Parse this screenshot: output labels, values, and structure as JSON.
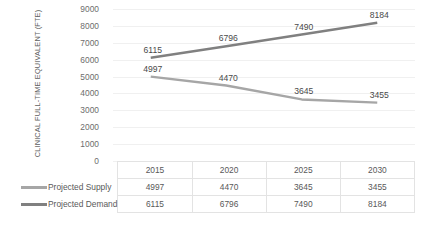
{
  "chart_data": {
    "type": "line",
    "title": "",
    "xlabel": "",
    "ylabel": "CLINICAL FULL-TIME EQUIVALENT (FTE)",
    "categories": [
      "2015",
      "2020",
      "2025",
      "2030"
    ],
    "series": [
      {
        "name": "Projected Supply",
        "values": [
          4997,
          4470,
          3645,
          3455
        ],
        "color": "#a6a6a6"
      },
      {
        "name": "Projected Demand",
        "values": [
          6115,
          6796,
          7490,
          8184
        ],
        "color": "#808080"
      }
    ],
    "ylim": [
      0,
      9000
    ],
    "ytick_labels": [
      "9000",
      "8000",
      "7000",
      "6000",
      "5000",
      "4000",
      "3000",
      "2000",
      "1000",
      "0"
    ],
    "ytick_values": [
      9000,
      8000,
      7000,
      6000,
      5000,
      4000,
      3000,
      2000,
      1000,
      0
    ],
    "grid": true,
    "legend_position": "data-table-left",
    "data_labels": true,
    "data_table": {
      "header_row": [
        "",
        "2015",
        "2020",
        "2025",
        "2030"
      ],
      "rows": [
        {
          "label": "Projected Supply",
          "cells": [
            "4997",
            "4470",
            "3645",
            "3455"
          ]
        },
        {
          "label": "Projected Demand",
          "cells": [
            "6115",
            "6796",
            "7490",
            "8184"
          ]
        }
      ]
    }
  }
}
